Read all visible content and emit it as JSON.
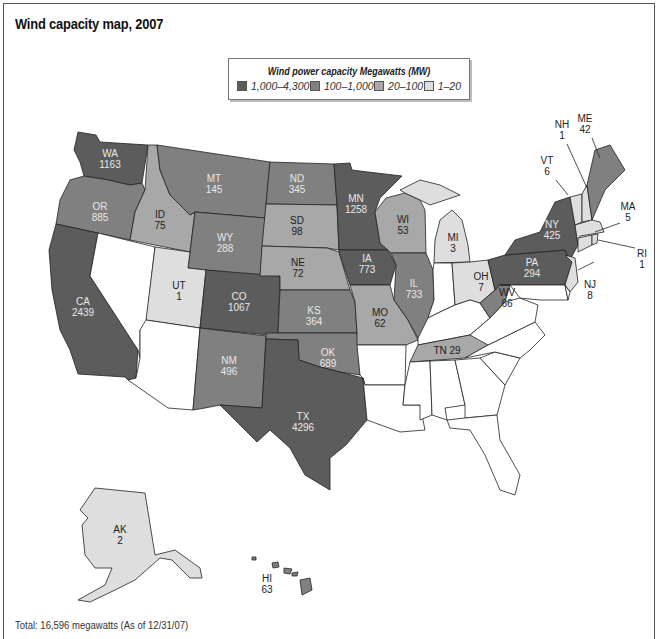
{
  "title": "Wind capacity map, 2007",
  "legend": {
    "title": "Wind power capacity Megawatts (MW)",
    "items": [
      {
        "label": "1,000–4,300",
        "color": "#5c5c5c"
      },
      {
        "label": "100–1,000",
        "color": "#808080"
      },
      {
        "label": "20–100",
        "color": "#a8a8a8"
      },
      {
        "label": "1–20",
        "color": "#dedede"
      }
    ]
  },
  "states": {
    "WA": {
      "abbr": "WA",
      "value": "1163"
    },
    "OR": {
      "abbr": "OR",
      "value": "885"
    },
    "CA": {
      "abbr": "CA",
      "value": "2439"
    },
    "ID": {
      "abbr": "ID",
      "value": "75"
    },
    "MT": {
      "abbr": "MT",
      "value": "145"
    },
    "WY": {
      "abbr": "WY",
      "value": "288"
    },
    "UT": {
      "abbr": "UT",
      "value": "1"
    },
    "CO": {
      "abbr": "CO",
      "value": "1067"
    },
    "NM": {
      "abbr": "NM",
      "value": "496"
    },
    "ND": {
      "abbr": "ND",
      "value": "345"
    },
    "SD": {
      "abbr": "SD",
      "value": "98"
    },
    "NE": {
      "abbr": "NE",
      "value": "72"
    },
    "KS": {
      "abbr": "KS",
      "value": "364"
    },
    "OK": {
      "abbr": "OK",
      "value": "689"
    },
    "TX": {
      "abbr": "TX",
      "value": "4296"
    },
    "MN": {
      "abbr": "MN",
      "value": "1258"
    },
    "IA": {
      "abbr": "IA",
      "value": "773"
    },
    "MO": {
      "abbr": "MO",
      "value": "62"
    },
    "WI": {
      "abbr": "WI",
      "value": "53"
    },
    "IL": {
      "abbr": "IL",
      "value": "733"
    },
    "MI": {
      "abbr": "MI",
      "value": "3"
    },
    "OH": {
      "abbr": "OH",
      "value": "7"
    },
    "TN": {
      "abbr": "TN",
      "value": "29",
      "label": "TN 29"
    },
    "WV": {
      "abbr": "WV",
      "value": "66"
    },
    "PA": {
      "abbr": "PA",
      "value": "294"
    },
    "NY": {
      "abbr": "NY",
      "value": "425"
    },
    "VT": {
      "abbr": "VT",
      "value": "6"
    },
    "NH": {
      "abbr": "NH",
      "value": "1"
    },
    "ME": {
      "abbr": "ME",
      "value": "42"
    },
    "MA": {
      "abbr": "MA",
      "value": "5"
    },
    "RI": {
      "abbr": "RI",
      "value": "1"
    },
    "NJ": {
      "abbr": "NJ",
      "value": "8"
    },
    "AK": {
      "abbr": "AK",
      "value": "2"
    },
    "HI": {
      "abbr": "HI",
      "value": "63"
    }
  },
  "footer": "Total: 16,596 megawatts (As of 12/31/07)"
}
